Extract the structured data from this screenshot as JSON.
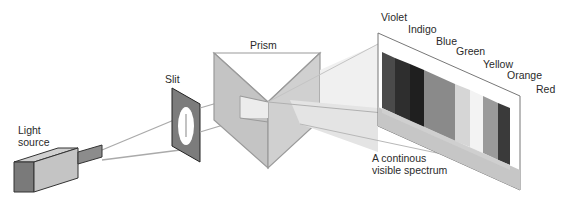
{
  "diagram": {
    "labels": {
      "light_source_line1": "Light",
      "light_source_line2": "source",
      "slit": "Slit",
      "prism": "Prism",
      "spectrum_line1": "A continous",
      "spectrum_line2": "visible spectrum"
    },
    "colors": [
      {
        "name": "Violet",
        "shade": "#4a4a4a"
      },
      {
        "name": "Indigo",
        "shade": "#2e2e2e"
      },
      {
        "name": "Blue",
        "shade": "#1f1f1f"
      },
      {
        "name": "Green",
        "shade": "#8a8a8a"
      },
      {
        "name": "Yellow",
        "shade": "#d6d6d6"
      },
      {
        "name": "Orange",
        "shade": "#9a9a9a"
      },
      {
        "name": "Red",
        "shade": "#3a3a3a"
      }
    ],
    "palette": {
      "outline": "#555555",
      "beam": "#aaaaaa",
      "prism_face": "#c8c8c8",
      "screen_base": "#bdbdbd"
    }
  }
}
